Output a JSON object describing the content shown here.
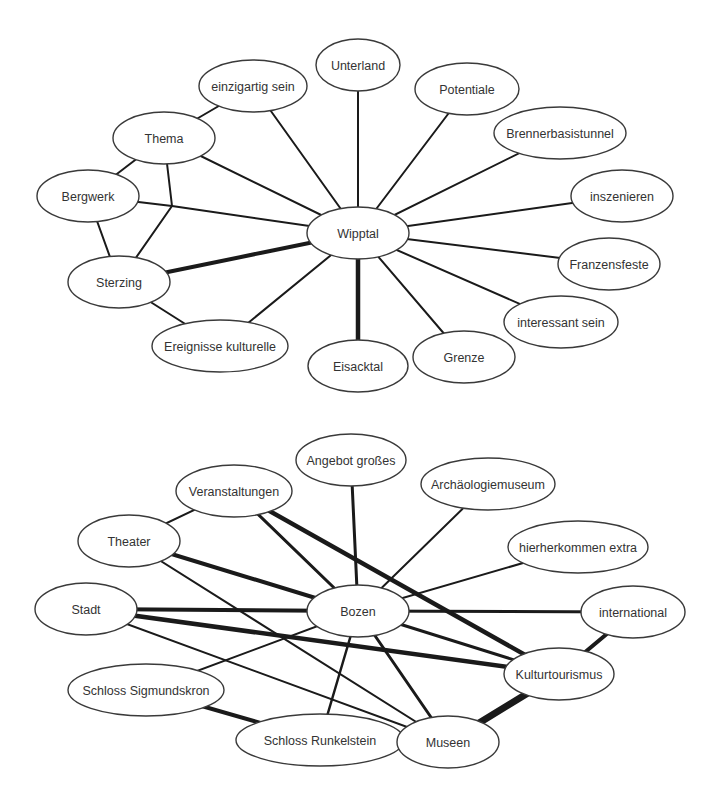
{
  "colors": {
    "edge": "#1a1a1a",
    "node_stroke": "#3a3a3a",
    "node_fill": "#ffffff",
    "text": "#333333",
    "background": "#ffffff"
  },
  "networks": [
    {
      "id": "wipptal",
      "center": "Wipptal",
      "nodes": [
        {
          "id": "unterland",
          "label": "Unterland",
          "x": 358,
          "y": 65,
          "rx": 42,
          "ry": 26
        },
        {
          "id": "einzigartig",
          "label": "einzigartig sein",
          "x": 253,
          "y": 86,
          "rx": 54,
          "ry": 26
        },
        {
          "id": "potentiale",
          "label": "Potentiale",
          "x": 467,
          "y": 89,
          "rx": 52,
          "ry": 26
        },
        {
          "id": "thema",
          "label": "Thema",
          "x": 164,
          "y": 138,
          "rx": 51,
          "ry": 26
        },
        {
          "id": "brenner",
          "label": "Brennerbasistunnel",
          "x": 560,
          "y": 133,
          "rx": 66,
          "ry": 26
        },
        {
          "id": "bergwerk",
          "label": "Bergwerk",
          "x": 88,
          "y": 196,
          "rx": 51,
          "ry": 26
        },
        {
          "id": "inszenieren",
          "label": "inszenieren",
          "x": 622,
          "y": 196,
          "rx": 51,
          "ry": 26
        },
        {
          "id": "wipptal",
          "label": "Wipptal",
          "x": 358,
          "y": 233,
          "rx": 51,
          "ry": 26
        },
        {
          "id": "franzensfeste",
          "label": "Franzensfeste",
          "x": 609,
          "y": 264,
          "rx": 51,
          "ry": 26
        },
        {
          "id": "sterzing",
          "label": "Sterzing",
          "x": 119,
          "y": 282,
          "rx": 51,
          "ry": 26
        },
        {
          "id": "interessant",
          "label": "interessant sein",
          "x": 561,
          "y": 322,
          "rx": 57,
          "ry": 26
        },
        {
          "id": "ereignisse",
          "label": "Ereignisse kulturelle",
          "x": 220,
          "y": 346,
          "rx": 68,
          "ry": 26
        },
        {
          "id": "grenze",
          "label": "Grenze",
          "x": 464,
          "y": 357,
          "rx": 51,
          "ry": 26
        },
        {
          "id": "eisacktal",
          "label": "Eisacktal",
          "x": 358,
          "y": 366,
          "rx": 50,
          "ry": 26
        }
      ],
      "junctions": [
        {
          "id": "j1",
          "x": 172,
          "y": 206
        }
      ],
      "edges": [
        {
          "from": "wipptal",
          "to": "unterland",
          "w": 2
        },
        {
          "from": "wipptal",
          "to": "einzigartig",
          "w": 2
        },
        {
          "from": "wipptal",
          "to": "potentiale",
          "w": 2
        },
        {
          "from": "wipptal",
          "to": "thema",
          "w": 2
        },
        {
          "from": "wipptal",
          "to": "brenner",
          "w": 2
        },
        {
          "from": "wipptal",
          "to": "inszenieren",
          "w": 2
        },
        {
          "from": "wipptal",
          "to": "franzensfeste",
          "w": 2
        },
        {
          "from": "wipptal",
          "to": "interessant",
          "w": 2
        },
        {
          "from": "wipptal",
          "to": "grenze",
          "w": 2
        },
        {
          "from": "wipptal",
          "to": "eisacktal",
          "w": 4.5
        },
        {
          "from": "wipptal",
          "to": "ereignisse",
          "w": 2
        },
        {
          "from": "wipptal",
          "to": "sterzing",
          "w": 4
        },
        {
          "from": "wipptal",
          "to": "j1",
          "w": 2
        },
        {
          "from": "bergwerk",
          "to": "j1",
          "w": 2
        },
        {
          "from": "thema",
          "to": "j1",
          "w": 2
        },
        {
          "from": "sterzing",
          "to": "j1",
          "w": 2
        },
        {
          "from": "thema",
          "to": "einzigartig",
          "w": 2
        },
        {
          "from": "thema",
          "to": "bergwerk",
          "w": 2
        },
        {
          "from": "bergwerk",
          "to": "sterzing",
          "w": 2
        },
        {
          "from": "sterzing",
          "to": "ereignisse",
          "w": 2
        }
      ]
    },
    {
      "id": "bozen",
      "center": "Bozen",
      "nodes": [
        {
          "id": "angebot",
          "label": "Angebot großes",
          "x": 351,
          "y": 460,
          "rx": 55,
          "ry": 26
        },
        {
          "id": "veranstaltungen",
          "label": "Veranstaltungen",
          "x": 234,
          "y": 491,
          "rx": 58,
          "ry": 26
        },
        {
          "id": "archaeologie",
          "label": "Archäologiemuseum",
          "x": 488,
          "y": 484,
          "rx": 67,
          "ry": 26
        },
        {
          "id": "theater",
          "label": "Theater",
          "x": 129,
          "y": 541,
          "rx": 51,
          "ry": 26
        },
        {
          "id": "hierher",
          "label": "hierherkommen extra",
          "x": 578,
          "y": 547,
          "rx": 70,
          "ry": 26
        },
        {
          "id": "stadt",
          "label": "Stadt",
          "x": 86,
          "y": 609,
          "rx": 51,
          "ry": 26
        },
        {
          "id": "bozen",
          "label": "Bozen",
          "x": 358,
          "y": 611,
          "rx": 51,
          "ry": 26
        },
        {
          "id": "international",
          "label": "international",
          "x": 633,
          "y": 612,
          "rx": 52,
          "ry": 26
        },
        {
          "id": "kultur",
          "label": "Kulturtourismus",
          "x": 559,
          "y": 674,
          "rx": 55,
          "ry": 26
        },
        {
          "id": "sigmundskron",
          "label": "Schloss Sigmundskron",
          "x": 146,
          "y": 690,
          "rx": 78,
          "ry": 26
        },
        {
          "id": "runkelstein",
          "label": "Schloss Runkelstein",
          "x": 320,
          "y": 740,
          "rx": 84,
          "ry": 26
        },
        {
          "id": "museen",
          "label": "Museen",
          "x": 448,
          "y": 742,
          "rx": 51,
          "ry": 26
        }
      ],
      "junctions": [],
      "edges": [
        {
          "from": "bozen",
          "to": "angebot",
          "w": 3
        },
        {
          "from": "bozen",
          "to": "veranstaltungen",
          "w": 3
        },
        {
          "from": "bozen",
          "to": "archaeologie",
          "w": 2
        },
        {
          "from": "bozen",
          "to": "theater",
          "w": 4
        },
        {
          "from": "bozen",
          "to": "hierher",
          "w": 2
        },
        {
          "from": "bozen",
          "to": "stadt",
          "w": 4
        },
        {
          "from": "bozen",
          "to": "international",
          "w": 3
        },
        {
          "from": "bozen",
          "to": "kultur",
          "w": 3
        },
        {
          "from": "bozen",
          "to": "sigmundskron",
          "w": 2
        },
        {
          "from": "bozen",
          "to": "runkelstein",
          "w": 2.5
        },
        {
          "from": "bozen",
          "to": "museen",
          "w": 3
        },
        {
          "from": "veranstaltungen",
          "to": "theater",
          "w": 2
        },
        {
          "from": "veranstaltungen",
          "to": "kultur",
          "w": 4.5
        },
        {
          "from": "theater",
          "to": "museen",
          "w": 2
        },
        {
          "from": "stadt",
          "to": "kultur",
          "w": 4.5
        },
        {
          "from": "stadt",
          "to": "museen",
          "w": 2
        },
        {
          "from": "international",
          "to": "kultur",
          "w": 4
        },
        {
          "from": "kultur",
          "to": "museen",
          "w": 7
        },
        {
          "from": "sigmundskron",
          "to": "runkelstein",
          "w": 4
        }
      ]
    }
  ]
}
